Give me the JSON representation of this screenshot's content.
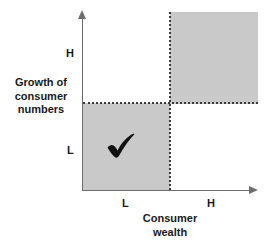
{
  "figure": {
    "type": "two-by-two-matrix",
    "background_color": "#ffffff",
    "shade_color": "#c9c9c9",
    "line_color": "#6e6e6e",
    "dotted_color": "#3a3a3a"
  },
  "y_axis": {
    "title_lines": [
      "Growth of",
      "consumer",
      "numbers"
    ],
    "ticks": [
      {
        "label": "L",
        "position": "low"
      },
      {
        "label": "H",
        "position": "high"
      }
    ]
  },
  "x_axis": {
    "title_lines": [
      "Consumer",
      "wealth"
    ],
    "ticks": [
      {
        "label": "L",
        "position": "low"
      },
      {
        "label": "H",
        "position": "high"
      }
    ]
  },
  "quadrants": [
    {
      "name": "low-growth-low-wealth",
      "x": "L",
      "y": "L",
      "shaded": true,
      "marker": "checkmark"
    },
    {
      "name": "high-growth-high-wealth",
      "x": "H",
      "y": "H",
      "shaded": true,
      "marker": null
    },
    {
      "name": "high-growth-low-wealth",
      "x": "L",
      "y": "H",
      "shaded": false,
      "marker": null
    },
    {
      "name": "low-growth-high-wealth",
      "x": "H",
      "y": "L",
      "shaded": false,
      "marker": null
    }
  ],
  "markers": {
    "checkmark": {
      "icon": "check-icon",
      "glyph": "✔",
      "color": "#111111"
    }
  }
}
